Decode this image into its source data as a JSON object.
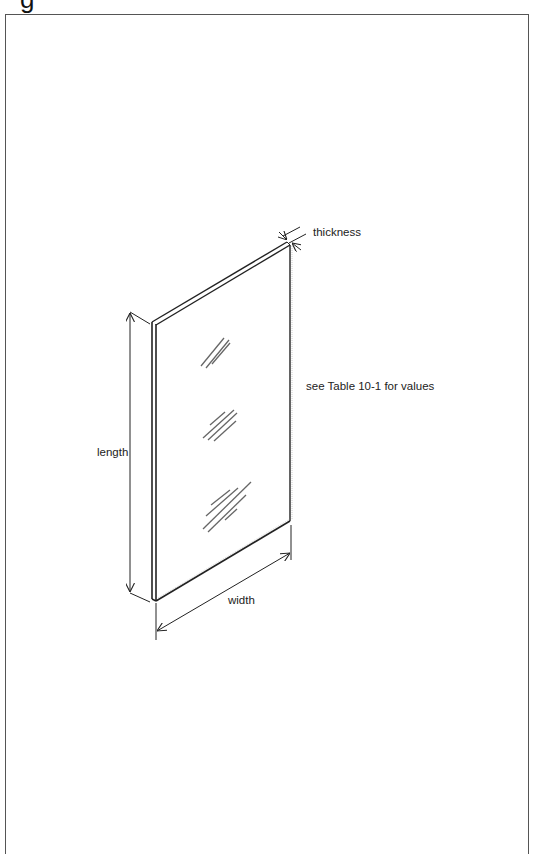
{
  "figure": {
    "cropped_title_glyph": "g",
    "labels": {
      "thickness": "thickness",
      "length": "length",
      "width": "width",
      "note": "see Table 10-1 for values"
    },
    "colors": {
      "line": "#222222",
      "frame": "#555555",
      "glare": "#666666",
      "background": "#ffffff"
    }
  }
}
